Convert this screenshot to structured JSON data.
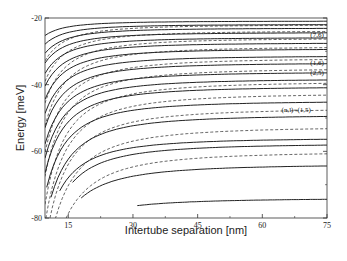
{
  "chart_data": {
    "type": "line",
    "title": "",
    "xlabel": "Intertube separation [nm]",
    "ylabel": "Energy [meV]",
    "xlim": [
      9.6,
      75
    ],
    "ylim": [
      -80,
      -20
    ],
    "x_ticks": [
      15,
      30,
      45,
      60,
      75
    ],
    "x_tick_labels": [
      "15",
      "30",
      "45",
      "60",
      "75"
    ],
    "y_ticks": [
      -20,
      -40,
      -60,
      -80
    ],
    "y_tick_labels": [
      "-20",
      "-40",
      "-60",
      "-80"
    ],
    "grid": false,
    "legend": null,
    "annotations": [
      {
        "text": "(7,6)",
        "x": 71,
        "E": -25.0
      },
      {
        "text": "(1,6)",
        "x": 71,
        "E": -33.5
      },
      {
        "text": "(2,5)",
        "x": 71,
        "E": -36.4
      },
      {
        "text": "(n,l)=(1,5)",
        "x": 68,
        "E": -47.6
      }
    ],
    "series_description": "Many solid (coupled-tube) and dashed (reference) energy-level curves rising with intertube separation; levels are dense near -20 meV and sparse near -80 meV.",
    "series": [
      {
        "name": "solid-1",
        "style": "solid",
        "E_inf": -74.0,
        "A": 2200,
        "x_start": 31
      },
      {
        "name": "solid-2",
        "style": "solid",
        "E_inf": -63.8,
        "A": 3300,
        "x_start": 18
      },
      {
        "name": "solid-3",
        "style": "solid",
        "E_inf": -57.6,
        "A": 3000,
        "x_start": 16
      },
      {
        "name": "solid-4",
        "style": "solid",
        "E_inf": -55.9,
        "A": 2700,
        "x_start": 13
      },
      {
        "name": "solid-5",
        "style": "solid",
        "E_inf": -49.0,
        "A": 3000,
        "x_start": 11
      },
      {
        "name": "solid-6",
        "style": "solid",
        "E_inf": -44.8,
        "A": 2600,
        "x_start": 10
      },
      {
        "name": "solid-7",
        "style": "solid",
        "E_inf": -40.5,
        "A": 2400,
        "x_start": 9.6
      },
      {
        "name": "solid-8",
        "style": "solid",
        "E_inf": -38.2,
        "A": 2200,
        "x_start": 9.6
      },
      {
        "name": "solid-9",
        "style": "solid",
        "E_inf": -36.1,
        "A": 2000,
        "x_start": 9.6
      },
      {
        "name": "solid-10",
        "style": "solid",
        "E_inf": -33.4,
        "A": 1800,
        "x_start": 9.6
      },
      {
        "name": "solid-11",
        "style": "solid",
        "E_inf": -31.3,
        "A": 1600,
        "x_start": 9.6
      },
      {
        "name": "solid-12",
        "style": "solid",
        "E_inf": -29.2,
        "A": 1400,
        "x_start": 9.6
      },
      {
        "name": "solid-13",
        "style": "solid",
        "E_inf": -27.4,
        "A": 1200,
        "x_start": 9.6
      },
      {
        "name": "solid-14",
        "style": "solid",
        "E_inf": -25.8,
        "A": 1000,
        "x_start": 9.6
      },
      {
        "name": "solid-15",
        "style": "solid",
        "E_inf": -24.3,
        "A": 850,
        "x_start": 9.6
      },
      {
        "name": "solid-16",
        "style": "solid",
        "E_inf": -23.0,
        "A": 700,
        "x_start": 9.6
      },
      {
        "name": "solid-17",
        "style": "solid",
        "E_inf": -21.9,
        "A": 550,
        "x_start": 9.6
      },
      {
        "name": "solid-18",
        "style": "solid",
        "E_inf": -20.9,
        "A": 400,
        "x_start": 9.6
      },
      {
        "name": "dashed-1",
        "style": "dashed",
        "E_inf": -60.0,
        "A": 4200,
        "x_start": 14
      },
      {
        "name": "dashed-2",
        "style": "dashed",
        "E_inf": -52.5,
        "A": 4000,
        "x_start": 12
      },
      {
        "name": "dashed-3",
        "style": "dashed",
        "E_inf": -47.0,
        "A": 3800,
        "x_start": 10.5
      },
      {
        "name": "dashed-4",
        "style": "dashed",
        "E_inf": -42.5,
        "A": 3600,
        "x_start": 9.6
      },
      {
        "name": "dashed-5",
        "style": "dashed",
        "E_inf": -39.0,
        "A": 3400,
        "x_start": 9.6
      },
      {
        "name": "dashed-6",
        "style": "dashed",
        "E_inf": -35.0,
        "A": 3000,
        "x_start": 9.6
      },
      {
        "name": "dashed-7",
        "style": "dashed",
        "E_inf": -32.0,
        "A": 2600,
        "x_start": 9.6
      },
      {
        "name": "dashed-8",
        "style": "dashed",
        "E_inf": -28.5,
        "A": 2200,
        "x_start": 9.6
      },
      {
        "name": "dashed-9",
        "style": "dashed",
        "E_inf": -26.0,
        "A": 1800,
        "x_start": 9.6
      },
      {
        "name": "dashed-10",
        "style": "dashed",
        "E_inf": -23.8,
        "A": 1400,
        "x_start": 9.6
      },
      {
        "name": "dashed-11",
        "style": "dashed",
        "E_inf": -22.0,
        "A": 1000,
        "x_start": 9.6
      }
    ]
  },
  "plot_area": {
    "left": 45,
    "top": 18,
    "right": 327,
    "bottom": 218
  }
}
